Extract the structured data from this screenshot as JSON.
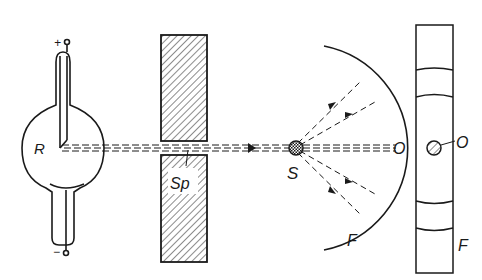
{
  "diagram": {
    "type": "x-ray-powder-diffraction-setup",
    "labels": {
      "tube": "R",
      "anode_terminal": "+",
      "cathode_terminal": "−",
      "slit": "Sp",
      "sample": "S",
      "film_arc": "F",
      "beam_exit": "O",
      "film_strip_spot": "O",
      "film_strip": "F"
    },
    "colors": {
      "ink": "#1a1a1a",
      "background": "#ffffff"
    }
  }
}
